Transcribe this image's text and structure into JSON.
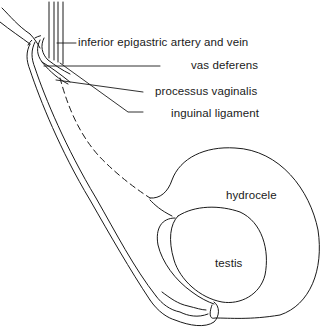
{
  "figure": {
    "type": "anatomical line drawing"
  },
  "labels": {
    "inferior_epigastric": "inferior epigastric artery and vein",
    "vas_deferens": "vas deferens",
    "processus_vaginalis": "processus vaginalis",
    "inguinal_ligament": "inguinal ligament",
    "hydrocele": "hydrocele",
    "testis": "testis"
  },
  "colors": {
    "line": "#1a1a1a",
    "background": "#ffffff"
  }
}
